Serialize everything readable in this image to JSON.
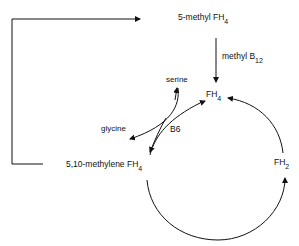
{
  "diagram": {
    "type": "folate-cycle",
    "nodes": {
      "methyl_fh4": {
        "text": "5-methyl FH",
        "sub": "4"
      },
      "fh4": {
        "text": "FH",
        "sub": "4"
      },
      "methylene_fh4": {
        "text": "5,10-methylene FH",
        "sub": "4"
      },
      "fh2": {
        "text": "FH",
        "sub": "2"
      },
      "serine": {
        "text": "serine"
      },
      "glycine": {
        "text": "glycine"
      }
    },
    "edge_labels": {
      "methyl_b12": {
        "text": "methyl B",
        "sub": "12"
      },
      "b6": {
        "text": "B6"
      }
    },
    "edges": [
      {
        "from": "5,10-methylene FH4",
        "to": "5-methyl FH4",
        "path": "left loop"
      },
      {
        "from": "5-methyl FH4",
        "to": "FH4",
        "label": "methyl B12"
      },
      {
        "from": "FH4",
        "to": "5,10-methylene FH4",
        "label": "B6"
      },
      {
        "from": "serine",
        "to": "glycine",
        "coupled": true
      },
      {
        "from": "5,10-methylene FH4",
        "to": "FH2",
        "path": "lower arc"
      },
      {
        "from": "FH2",
        "to": "FH4",
        "path": "right arc"
      }
    ],
    "colors": {
      "line": "#111111",
      "background": "#ffffff"
    }
  }
}
